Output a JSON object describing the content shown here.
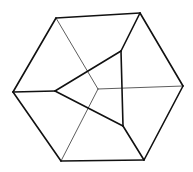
{
  "diagram": {
    "type": "geometric-figure",
    "colors": {
      "background": "#ffffff",
      "stroke": "#111111",
      "thin_stroke": "#333333"
    },
    "vertices": {
      "hex_top_left": [
        56,
        18
      ],
      "hex_top_right": [
        140,
        13
      ],
      "hex_right": [
        183,
        86
      ],
      "hex_bottom_right": [
        144,
        160
      ],
      "hex_bottom_left": [
        61,
        161
      ],
      "hex_left": [
        13,
        92
      ],
      "tri_top": [
        121,
        51
      ],
      "tri_left": [
        55,
        91
      ],
      "tri_bottom": [
        123,
        126
      ],
      "center": [
        98,
        89
      ]
    },
    "thick_edges": [
      [
        "hex_top_left",
        "hex_top_right"
      ],
      [
        "hex_top_right",
        "hex_right"
      ],
      [
        "hex_right",
        "hex_bottom_right"
      ],
      [
        "hex_bottom_right",
        "hex_bottom_left"
      ],
      [
        "hex_bottom_left",
        "hex_left"
      ],
      [
        "hex_left",
        "hex_top_left"
      ],
      [
        "tri_top",
        "tri_left"
      ],
      [
        "tri_left",
        "tri_bottom"
      ],
      [
        "tri_bottom",
        "tri_top"
      ],
      [
        "hex_top_right",
        "tri_top"
      ],
      [
        "hex_left",
        "tri_left"
      ],
      [
        "hex_bottom_right",
        "tri_bottom"
      ]
    ],
    "thin_edges": [
      [
        "hex_top_left",
        "center"
      ],
      [
        "hex_right",
        "center"
      ],
      [
        "hex_bottom_left",
        "center"
      ]
    ]
  }
}
